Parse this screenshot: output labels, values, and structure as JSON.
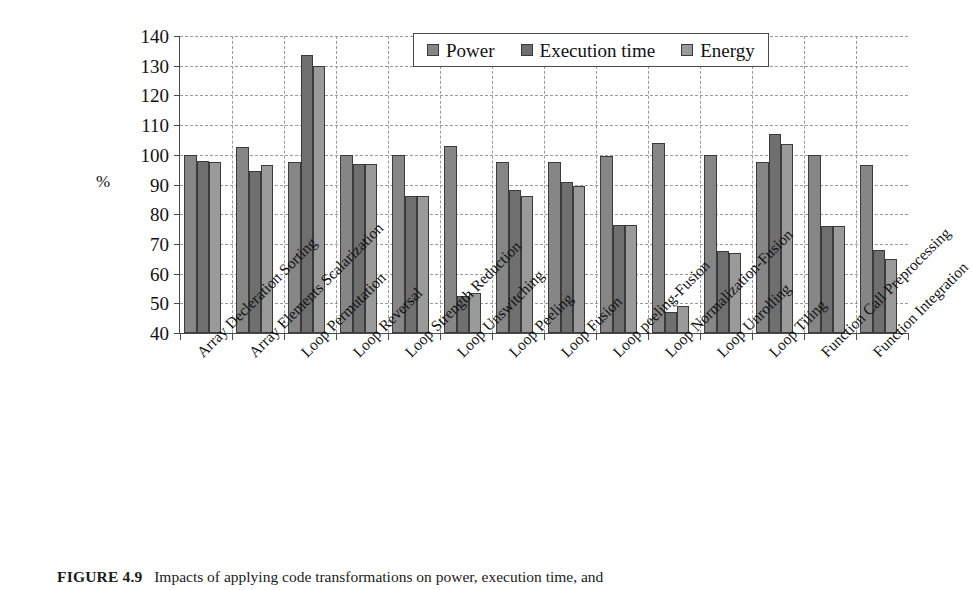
{
  "figure": {
    "caption_label": "FIGURE 4.9",
    "caption_text": "Impacts of applying code transformations on power, execution time, and"
  },
  "chart_data": {
    "type": "bar",
    "title": "",
    "xlabel": "",
    "ylabel": "%",
    "ylim": [
      40,
      140
    ],
    "ytick_step": 10,
    "yticks": [
      140,
      130,
      120,
      110,
      100,
      90,
      80,
      70,
      60,
      50,
      40
    ],
    "grid": true,
    "legend_position": "top-center",
    "categories": [
      "Array Decleration Sorting",
      "Array Elements Scalarization",
      "Loop Permutation",
      "Loop Reversal",
      "Loop Strength Reduction",
      "Loop Unswitching",
      "Loop Peeling",
      "Loop Fusion",
      "Loop peeling-Fusion",
      "Loop Normalization-Fusion",
      "Loop Unrolling",
      "Loop Tiling",
      "Function Call Preprocessing",
      "Function Integration"
    ],
    "series": [
      {
        "name": "Power",
        "color": "#868686",
        "values": [
          100,
          102.5,
          97.5,
          100,
          100,
          103,
          97.5,
          97.5,
          99.5,
          104,
          100,
          97.5,
          100,
          96.5
        ]
      },
      {
        "name": "Execution time",
        "color": "#6f6f6f",
        "values": [
          98,
          94.5,
          133.5,
          97,
          86,
          52.5,
          88,
          91,
          76.5,
          47,
          67.5,
          107,
          76,
          68
        ]
      },
      {
        "name": "Energy",
        "color": "#9a9a9a",
        "values": [
          97.5,
          96.5,
          130,
          97,
          86,
          53.5,
          86,
          89.5,
          76.5,
          49,
          67,
          103.5,
          76,
          65
        ]
      }
    ]
  }
}
